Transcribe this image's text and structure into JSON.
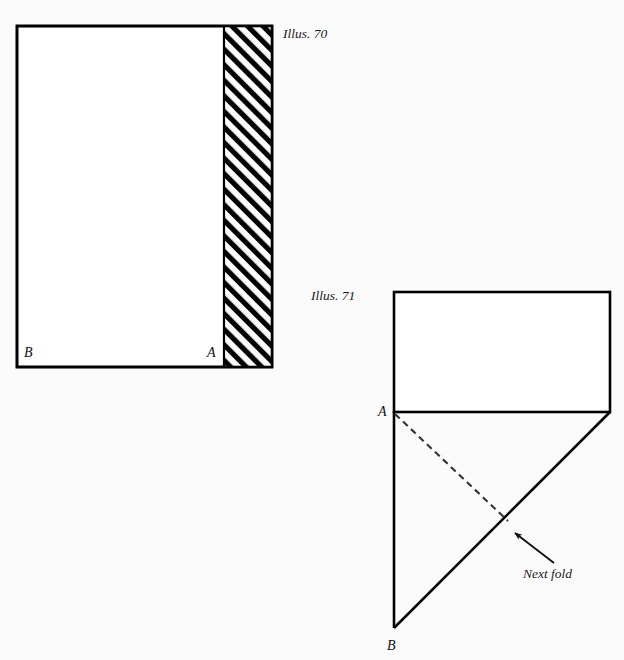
{
  "page": {
    "background_color": "#fbfbfc",
    "ink_color": "#000000"
  },
  "figures": [
    {
      "id": "illus-70",
      "caption": "Illus. 70",
      "caption_position": {
        "x": 283,
        "y": 38
      },
      "rect": {
        "x1": 17,
        "y1": 26,
        "x2": 272,
        "y2": 367
      },
      "hatch_band": {
        "x1": 224,
        "y1": 26,
        "x2": 272,
        "y2": 367,
        "angle_degrees": 45,
        "line_color": "#000000",
        "gap_color": "#ffffff"
      },
      "labels": [
        {
          "name": "point-label-b",
          "text": "B",
          "x": 24,
          "y": 357
        },
        {
          "name": "point-label-a",
          "text": "A",
          "x": 207,
          "y": 357
        }
      ]
    },
    {
      "id": "illus-71",
      "caption": "Illus. 71",
      "caption_position": {
        "x": 311,
        "y": 300
      },
      "rect": {
        "x1": 394,
        "y1": 292,
        "x2": 610,
        "y2": 412
      },
      "vertical_edge": {
        "x1": 394,
        "y1": 412,
        "x2": 394,
        "y2": 628
      },
      "diagonal_fold": {
        "x1": 394,
        "y1": 628,
        "x2": 610,
        "y2": 412
      },
      "dashed_fold_line": {
        "x1": 394,
        "y1": 414,
        "x2": 508,
        "y2": 521
      },
      "labels": [
        {
          "name": "point-label-a",
          "text": "A",
          "x": 378,
          "y": 416
        },
        {
          "name": "point-label-b",
          "text": "B",
          "x": 387,
          "y": 650
        }
      ],
      "annotation": {
        "text": "Next fold",
        "text_x": 523,
        "text_y": 578,
        "arrow_tail": {
          "x": 554,
          "y": 563
        },
        "arrow_tip": {
          "x": 511,
          "y": 530
        }
      }
    }
  ]
}
